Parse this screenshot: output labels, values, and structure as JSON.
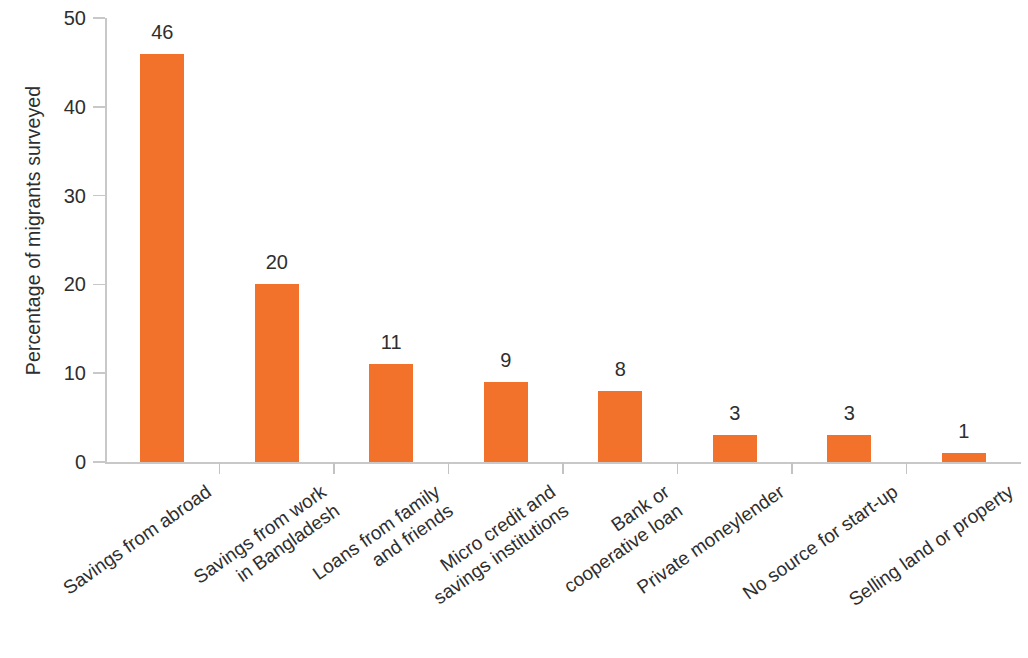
{
  "chart_data": {
    "type": "bar",
    "title": "",
    "subtitle": "",
    "xlabel": "",
    "ylabel": "Percentage of migrants surveyed",
    "ylim": [
      0,
      50
    ],
    "y_ticks": [
      0,
      10,
      20,
      30,
      40,
      50
    ],
    "grid": false,
    "legend": null,
    "bar_color": "#F2722B",
    "axis_color": "#C8C8C8",
    "text_color": "#2E2E2E",
    "label_rotation_deg": -35,
    "categories": [
      "Savings from abroad",
      "Savings from work\nin Bangladesh",
      "Loans from family\nand friends",
      "Micro credit and\nsavings institutions",
      "Bank or\ncooperative loan",
      "Private moneylender",
      "No source for start-up",
      "Selling land or property"
    ],
    "values": [
      46,
      20,
      11,
      9,
      8,
      3,
      3,
      1
    ],
    "value_labels": [
      "46",
      "20",
      "11",
      "9",
      "8",
      "3",
      "3",
      "1"
    ],
    "y_tick_labels": [
      "0",
      "10",
      "20",
      "30",
      "40",
      "50"
    ]
  }
}
